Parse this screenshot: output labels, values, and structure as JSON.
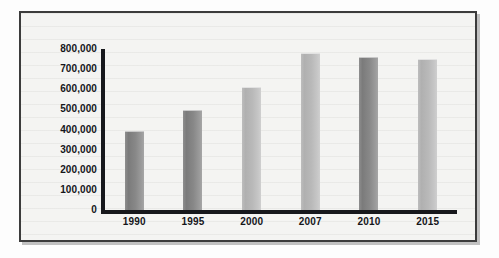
{
  "chart_data": {
    "type": "bar",
    "title": "",
    "subtitle": "",
    "xlabel": "",
    "ylabel": "",
    "categories": [
      "1990",
      "1995",
      "2000",
      "2007",
      "2010",
      "2015"
    ],
    "values": [
      395000,
      497000,
      612000,
      780000,
      760000,
      750000
    ],
    "series": [
      {
        "name": "",
        "values": [
          395000,
          497000,
          612000,
          780000,
          760000,
          750000
        ]
      }
    ],
    "ylim": [
      0,
      800000
    ],
    "y_ticks": [
      800000,
      700000,
      600000,
      500000,
      400000,
      300000,
      200000,
      100000,
      0
    ],
    "y_tick_labels": [
      "800,000",
      "700,000",
      "600,000",
      "500,000",
      "400,000",
      "300,000",
      "200,000",
      "100,000",
      "0"
    ],
    "grid": false,
    "legend": null,
    "legend_position": "none",
    "bar_shades": [
      "dark",
      "dark",
      "light",
      "light",
      "dark",
      "light"
    ],
    "annotations": []
  },
  "colors": {
    "frame_border": "#3c3c3c",
    "plot_background": "#f4f4f2",
    "axis": "#17181c",
    "bar_dark": "#888888",
    "bar_light": "#b9b9b9",
    "tick_text": "#15161a"
  }
}
